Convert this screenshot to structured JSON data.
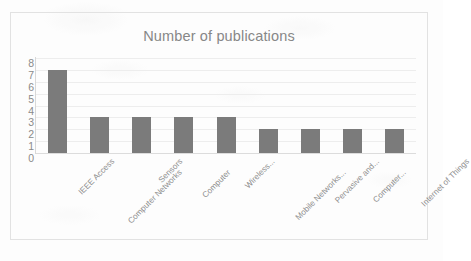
{
  "chart_data": {
    "type": "bar",
    "title": "Number of publications",
    "xlabel": "",
    "ylabel": "",
    "ylim": [
      0,
      8
    ],
    "ytick_step": 1,
    "yticks": [
      8,
      7,
      6,
      5,
      4,
      3,
      2,
      1,
      0
    ],
    "grid": true,
    "legend": false,
    "bar_color": "#7b7b7b",
    "categories": [
      "IEEE Access",
      "Computer Networks",
      "Sensors",
      "Computer",
      "Wireless...",
      "Mobile Networks...",
      "Pervasive and...",
      "Computer...",
      "Internet of Things"
    ],
    "values": [
      7,
      3,
      3,
      3,
      3,
      2,
      2,
      2,
      2
    ]
  },
  "colors": {
    "bar": "#7b7b7b",
    "title_text": "#878787",
    "tick_text": "#8a8a8a",
    "category_text": "#8d8d8d",
    "gridline": "#ededed",
    "frame_border": "#e2e2e2",
    "page_background": "#fdfdfd"
  }
}
